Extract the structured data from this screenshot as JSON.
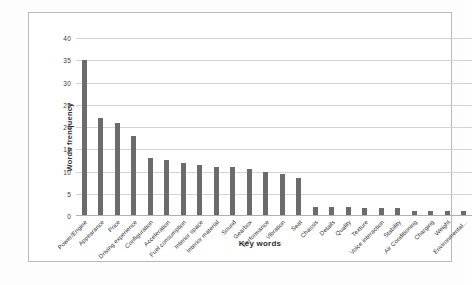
{
  "chart_data": {
    "type": "bar",
    "title": "",
    "xlabel": "Key words",
    "ylabel": "Words frenquency",
    "ylim": [
      0,
      40
    ],
    "yticks": [
      0,
      5,
      10,
      15,
      20,
      25,
      30,
      35,
      40
    ],
    "grid": true,
    "legend": false,
    "bar_color": "#6b6b6b",
    "categories": [
      "Power/Engine",
      "Appearance",
      "Price",
      "Driving experience",
      "Configuration",
      "Acceleration",
      "Fuel consumption",
      "Interior space",
      "Interior material",
      "Sound",
      "Gearbox",
      "Performance",
      "Vibration",
      "Seat",
      "Chassis",
      "Details",
      "Quality",
      "Texture",
      "Voice interaction",
      "Stability",
      "Air Conditioning",
      "Charging",
      "Weight",
      "Environmental..."
    ],
    "values": [
      35,
      22,
      21,
      18,
      13,
      12.5,
      12,
      11.5,
      11,
      11,
      10.5,
      10,
      9.5,
      8.5,
      2,
      2,
      2,
      1.8,
      1.8,
      1.8,
      1.2,
      1.2,
      1.2,
      1.1
    ]
  },
  "axis": {
    "y_title": "Words frenquency",
    "x_title": "Key words"
  }
}
